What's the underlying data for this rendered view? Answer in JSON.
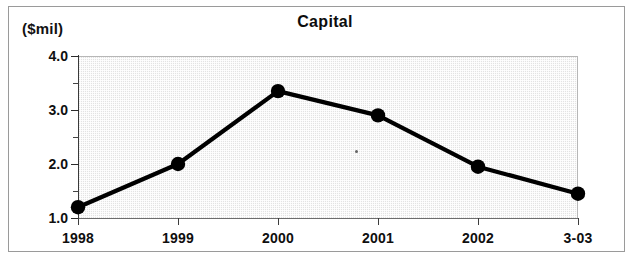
{
  "figure": {
    "units_label": "($mil)",
    "title": "Capital"
  },
  "chart_data": {
    "type": "line",
    "title": "Capital",
    "subtitle": "",
    "xlabel": "",
    "ylabel": "($mil)",
    "units": "$mil",
    "categories": [
      "1998",
      "1999",
      "2000",
      "2001",
      "2002",
      "3-03"
    ],
    "values": [
      1.2,
      2.0,
      3.35,
      2.9,
      1.95,
      1.45
    ],
    "series": [
      {
        "name": "Capital",
        "values": [
          1.2,
          2.0,
          3.35,
          2.9,
          1.95,
          1.45
        ]
      }
    ],
    "ylim": [
      1.0,
      4.0
    ],
    "y_major_ticks": [
      "1.0",
      "2.0",
      "3.0",
      "4.0"
    ],
    "y_major_values": [
      1.0,
      2.0,
      3.0,
      4.0
    ],
    "y_minor_values": [
      1.5,
      2.5,
      3.5
    ],
    "grid": false,
    "legend": "none",
    "marker": "filled-circle",
    "line_color": "#000000",
    "plot_background": "#e3e3e3"
  },
  "axis": {
    "y_labels": [
      "4.0",
      "3.0",
      "2.0",
      "1.0"
    ],
    "x_labels": [
      "1998",
      "1999",
      "2000",
      "2001",
      "2002",
      "3-03"
    ]
  }
}
